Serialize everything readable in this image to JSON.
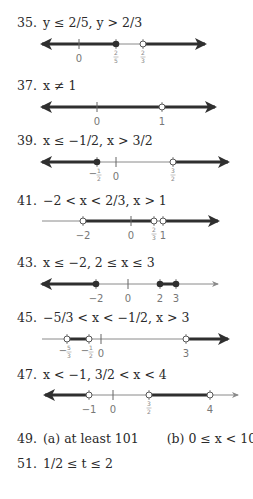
{
  "problems": [
    {
      "number": "35.",
      "text": "y ≤ 2/5, y > 2/3",
      "line": {
        "y": 44,
        "x1": 42,
        "x2": 205,
        "left_arrow": true,
        "right_arrow": true,
        "ticks": [
          {
            "x": 79,
            "label": "0"
          }
        ],
        "points": [
          {
            "x": 116,
            "type": "closed",
            "label": "2/5"
          },
          {
            "x": 143,
            "type": "open",
            "label": "2/3"
          }
        ],
        "thick": [
          [
            42,
            116
          ],
          [
            143,
            205
          ]
        ]
      }
    },
    {
      "number": "37.",
      "text": "x ≠ 1",
      "line": {
        "y": 107,
        "x1": 42,
        "x2": 215,
        "left_arrow": true,
        "right_arrow": true,
        "ticks": [
          {
            "x": 97,
            "label": "0"
          }
        ],
        "points": [
          {
            "x": 162,
            "type": "open",
            "label": "1"
          }
        ],
        "thick": [
          [
            42,
            162
          ],
          [
            162,
            215
          ]
        ]
      }
    },
    {
      "number": "39.",
      "text": "x ≤ −1/2, x > 3/2",
      "line": {
        "y": 162,
        "x1": 42,
        "x2": 228,
        "left_arrow": true,
        "right_arrow": true,
        "ticks": [
          {
            "x": 116,
            "label": "0"
          }
        ],
        "points": [
          {
            "x": 97,
            "type": "closed",
            "label": "−1/2"
          },
          {
            "x": 173,
            "type": "open",
            "label": "3/2"
          }
        ],
        "thick": [
          [
            42,
            97
          ],
          [
            173,
            228
          ]
        ]
      }
    },
    {
      "number": "41.",
      "text": "−2 < x < 2/3, x > 1",
      "line": {
        "y": 221,
        "x1": 42,
        "x2": 218,
        "left_arrow": false,
        "right_arrow": true,
        "ticks": [
          {
            "x": 131,
            "label": "0"
          }
        ],
        "points": [
          {
            "x": 83,
            "type": "open",
            "label": "−2"
          },
          {
            "x": 154,
            "type": "open",
            "label": "2/3"
          },
          {
            "x": 163,
            "type": "open",
            "label": "1"
          }
        ],
        "thick": [
          [
            83,
            154
          ],
          [
            163,
            218
          ]
        ]
      }
    },
    {
      "number": "43.",
      "text": "x ≤ −2, 2 ≤ x ≤ 3",
      "line": {
        "y": 284,
        "x1": 42,
        "x2": 218,
        "left_arrow": true,
        "right_arrow": false,
        "ticks": [
          {
            "x": 128,
            "label": "0"
          }
        ],
        "points": [
          {
            "x": 96,
            "type": "closed",
            "label": "−2"
          },
          {
            "x": 160,
            "type": "closed",
            "label": "2"
          },
          {
            "x": 176,
            "type": "closed",
            "label": "3"
          }
        ],
        "thick": [
          [
            42,
            96
          ],
          [
            160,
            176
          ]
        ]
      }
    },
    {
      "number": "45.",
      "text": "−5/3 < x < −1/2, x > 3",
      "line": {
        "y": 339,
        "x1": 42,
        "x2": 228,
        "left_arrow": false,
        "right_arrow": true,
        "ticks": [
          {
            "x": 101,
            "label": "0"
          }
        ],
        "points": [
          {
            "x": 67,
            "type": "open",
            "label": "−5/3"
          },
          {
            "x": 89,
            "type": "open",
            "label": "−1/2"
          },
          {
            "x": 186,
            "type": "open",
            "label": "3"
          }
        ],
        "thick": [
          [
            67,
            89
          ],
          [
            186,
            228
          ]
        ]
      }
    },
    {
      "number": "47.",
      "text": "x < −1, 3/2 < x < 4",
      "line": {
        "y": 395,
        "x1": 45,
        "x2": 238,
        "left_arrow": true,
        "right_arrow": false,
        "ticks": [
          {
            "x": 113,
            "label": "0"
          }
        ],
        "points": [
          {
            "x": 89,
            "type": "open",
            "label": "−1"
          },
          {
            "x": 149,
            "type": "open",
            "label": "3/2"
          },
          {
            "x": 210,
            "type": "open",
            "label": "4"
          }
        ],
        "thick": [
          [
            45,
            89
          ],
          [
            149,
            210
          ]
        ]
      }
    }
  ],
  "text_problems": [
    {
      "number": "49.",
      "part_a": "(a)  at least 101",
      "part_b": "(b)  0 ≤ x < 100"
    },
    {
      "number": "51.",
      "text": "1/2 ≤ t ≤ 2"
    }
  ],
  "colors": {
    "line": "#2f2f2f",
    "thin": "#8a8a8a",
    "label": "#777777"
  }
}
